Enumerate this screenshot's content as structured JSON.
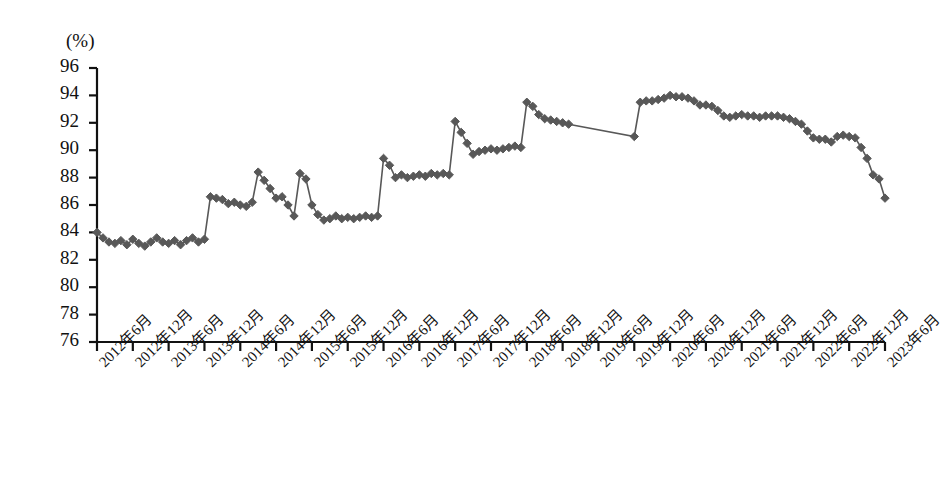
{
  "chart_data": {
    "type": "line",
    "title": "",
    "subtitle": "",
    "xlabel": "",
    "ylabel": "",
    "unit_label": "(%)",
    "ylim": [
      76,
      96
    ],
    "yticks": [
      76,
      78,
      80,
      82,
      84,
      86,
      88,
      90,
      92,
      94,
      96
    ],
    "grid": false,
    "legend": "none",
    "marker": "diamond",
    "series_color": "#585858",
    "line_color": "#585858",
    "axis_color": "#111111",
    "xtick_labels": [
      "2012年6月",
      "2012年12月",
      "2013年6月",
      "2013年12月",
      "2014年6月",
      "2014年12月",
      "2015年6月",
      "2015年12月",
      "2016年6月",
      "2016年12月",
      "2017年6月",
      "2017年12月",
      "2018年6月",
      "2018年12月",
      "2019年6月",
      "2019年12月",
      "2020年6月",
      "2020年12月",
      "2021年6月",
      "2021年12月",
      "2022年6月",
      "2022年12月",
      "2023年6月"
    ],
    "x_start": "2012-06",
    "x_end": "2023-06",
    "x_step_months": 1,
    "series": [
      {
        "name": "",
        "x": [
          "2012-06",
          "2012-07",
          "2012-08",
          "2012-09",
          "2012-10",
          "2012-11",
          "2012-12",
          "2013-01",
          "2013-02",
          "2013-03",
          "2013-04",
          "2013-05",
          "2013-06",
          "2013-07",
          "2013-08",
          "2013-09",
          "2013-10",
          "2013-11",
          "2013-12",
          "2014-01",
          "2014-02",
          "2014-03",
          "2014-04",
          "2014-05",
          "2014-06",
          "2014-07",
          "2014-08",
          "2014-09",
          "2014-10",
          "2014-11",
          "2014-12",
          "2015-01",
          "2015-02",
          "2015-03",
          "2015-04",
          "2015-05",
          "2015-06",
          "2015-07",
          "2015-08",
          "2015-09",
          "2015-10",
          "2015-11",
          "2015-12",
          "2016-01",
          "2016-02",
          "2016-03",
          "2016-04",
          "2016-05",
          "2016-06",
          "2016-07",
          "2016-08",
          "2016-09",
          "2016-10",
          "2016-11",
          "2016-12",
          "2017-01",
          "2017-02",
          "2017-03",
          "2017-04",
          "2017-05",
          "2017-06",
          "2017-07",
          "2017-08",
          "2017-09",
          "2017-10",
          "2017-11",
          "2017-12",
          "2018-01",
          "2018-02",
          "2018-03",
          "2018-04",
          "2018-05",
          "2018-06",
          "2018-07",
          "2018-08",
          "2018-09",
          "2018-10",
          "2018-11",
          "2018-12",
          "2019-01",
          "2019-12",
          "2020-01",
          "2020-02",
          "2020-03",
          "2020-04",
          "2020-05",
          "2020-06",
          "2020-07",
          "2020-08",
          "2020-09",
          "2020-10",
          "2020-11",
          "2020-12",
          "2021-01",
          "2021-02",
          "2021-03",
          "2021-04",
          "2021-05",
          "2021-06",
          "2021-07",
          "2021-08",
          "2021-09",
          "2021-10",
          "2021-11",
          "2021-12",
          "2022-01",
          "2022-02",
          "2022-03",
          "2022-04",
          "2022-05",
          "2022-06",
          "2022-07",
          "2022-08",
          "2022-09",
          "2022-10",
          "2022-11",
          "2022-12",
          "2023-01",
          "2023-02",
          "2023-03",
          "2023-04",
          "2023-05",
          "2023-06"
        ],
        "values": [
          84.0,
          83.6,
          83.3,
          83.2,
          83.4,
          83.1,
          83.5,
          83.2,
          83.0,
          83.3,
          83.6,
          83.3,
          83.2,
          83.4,
          83.1,
          83.4,
          83.6,
          83.3,
          83.5,
          86.6,
          86.5,
          86.4,
          86.1,
          86.2,
          86.0,
          85.9,
          86.2,
          88.4,
          87.8,
          87.2,
          86.5,
          86.6,
          86.0,
          85.2,
          88.3,
          87.9,
          86.0,
          85.3,
          84.9,
          85.0,
          85.2,
          85.0,
          85.1,
          85.0,
          85.1,
          85.2,
          85.1,
          85.2,
          89.4,
          88.9,
          88.0,
          88.2,
          88.0,
          88.1,
          88.2,
          88.1,
          88.3,
          88.2,
          88.3,
          88.2,
          92.1,
          91.3,
          90.5,
          89.7,
          89.9,
          90.0,
          90.1,
          90.0,
          90.1,
          90.2,
          90.3,
          90.2,
          93.5,
          93.2,
          92.6,
          92.3,
          92.2,
          92.1,
          92.0,
          91.9,
          91.0,
          93.5,
          93.6,
          93.6,
          93.7,
          93.8,
          94.0,
          93.9,
          93.9,
          93.8,
          93.6,
          93.3,
          93.3,
          93.2,
          92.9,
          92.5,
          92.4,
          92.5,
          92.6,
          92.5,
          92.5,
          92.4,
          92.5,
          92.5,
          92.5,
          92.4,
          92.3,
          92.1,
          91.9,
          91.4,
          90.9,
          90.8,
          90.8,
          90.6,
          91.0,
          91.1,
          91.0,
          90.9,
          90.2,
          89.4,
          88.2,
          87.9,
          86.5
        ]
      }
    ],
    "annotations": [
      {
        "type": "gap",
        "from": "2019-01",
        "to": "2019-12",
        "note": "no data points plotted between these dates; connected by straight line"
      }
    ]
  }
}
